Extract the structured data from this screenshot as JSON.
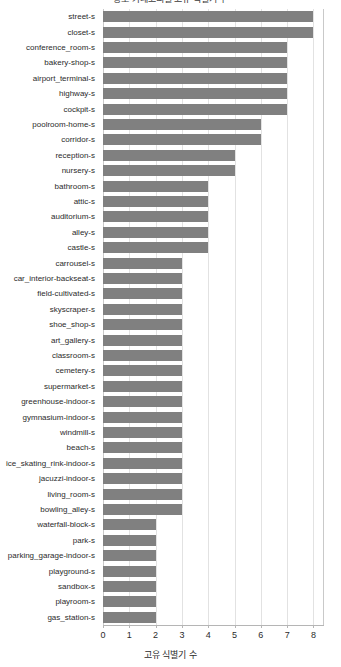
{
  "chart_data": {
    "type": "bar",
    "orientation": "horizontal",
    "title": "장소 카테고리별 고유 식별기 수",
    "xlabel": "고유 식별기 수",
    "ylabel": "",
    "xlim": [
      0,
      8.4
    ],
    "xticks": [
      0,
      1,
      2,
      3,
      4,
      5,
      6,
      7,
      8
    ],
    "xtick_labels": [
      "0",
      "1",
      "2",
      "3",
      "4",
      "5",
      "6",
      "7",
      "8"
    ],
    "grid": true,
    "grid_axis": "x",
    "legend": false,
    "bar_color": "#808080",
    "categories": [
      "street-s",
      "closet-s",
      "conference_room-s",
      "bakery-shop-s",
      "airport_terminal-s",
      "highway-s",
      "cockpit-s",
      "poolroom-home-s",
      "corridor-s",
      "reception-s",
      "nursery-s",
      "bathroom-s",
      "attic-s",
      "auditorium-s",
      "alley-s",
      "castle-s",
      "carrousel-s",
      "car_interior-backseat-s",
      "field-cultivated-s",
      "skyscraper-s",
      "shoe_shop-s",
      "art_gallery-s",
      "classroom-s",
      "cemetery-s",
      "supermarket-s",
      "greenhouse-indoor-s",
      "gymnasium-indoor-s",
      "windmill-s",
      "beach-s",
      "ice_skating_rink-indoor-s",
      "jacuzzi-indoor-s",
      "living_room-s",
      "bowling_alley-s",
      "waterfall-block-s",
      "park-s",
      "parking_garage-indoor-s",
      "playground-s",
      "sandbox-s",
      "playroom-s",
      "gas_station-s"
    ],
    "values": [
      8,
      8,
      7,
      7,
      7,
      7,
      7,
      6,
      6,
      5,
      5,
      4,
      4,
      4,
      4,
      4,
      3,
      3,
      3,
      3,
      3,
      3,
      3,
      3,
      3,
      3,
      3,
      3,
      3,
      3,
      3,
      3,
      3,
      2,
      2,
      2,
      2,
      2,
      2,
      2
    ]
  }
}
